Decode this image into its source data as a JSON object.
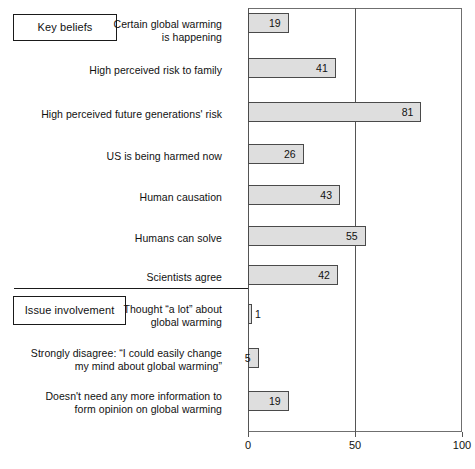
{
  "chart_data": {
    "type": "bar",
    "orientation": "horizontal",
    "title": "",
    "xlabel": "",
    "ylabel": "",
    "xlim": [
      0,
      100
    ],
    "xticks": [
      0,
      50,
      100
    ],
    "xtick_labels": [
      "0",
      "50",
      "100"
    ],
    "grid": "vertical gridline at 50 only",
    "legend": "none",
    "bar_fill_color": "#dedede",
    "bar_edge_color": "#4a4a4a",
    "groups": [
      {
        "name": "Key beliefs",
        "label": "Key beliefs",
        "categories": [
          "Certain global warming\nis happening",
          "High perceived risk to family",
          "High perceived future generations' risk",
          "US is being harmed now",
          "Human causation",
          "Humans can solve",
          "Scientists agree"
        ],
        "values": [
          19,
          41,
          81,
          26,
          43,
          55,
          42
        ]
      },
      {
        "name": "Issue involvement",
        "label": "Issue involvement",
        "categories": [
          "Thought “a lot” about\nglobal warming",
          "Strongly disagree: “I could easily change\nmy mind about global warming”",
          "Doesn't need any more information to\nform opinion on global warming"
        ],
        "values": [
          1,
          5,
          19
        ]
      }
    ],
    "categories": [
      "Certain global warming\nis happening",
      "High perceived risk to family",
      "High perceived future generations' risk",
      "US is being harmed now",
      "Human causation",
      "Humans can solve",
      "Scientists agree",
      "Thought “a lot” about\nglobal warming",
      "Strongly disagree: “I could easily change\nmy mind about global warming”",
      "Doesn't need any more information to\nform opinion on global warming"
    ],
    "values": [
      19,
      41,
      81,
      26,
      43,
      55,
      42,
      1,
      5,
      19
    ]
  },
  "rows": [
    {
      "label": "Certain global warming\nis happening",
      "value": 19,
      "value_text": "19",
      "label_top": 18,
      "bar_top": 13,
      "value_position": "inside"
    },
    {
      "label": "High perceived risk to family",
      "value": 41,
      "value_text": "41",
      "label_top": 64,
      "bar_top": 58,
      "value_position": "inside"
    },
    {
      "label": "High perceived future generations' risk",
      "value": 81,
      "value_text": "81",
      "label_top": 108,
      "bar_top": 102,
      "value_position": "inside"
    },
    {
      "label": "US is being harmed now",
      "value": 26,
      "value_text": "26",
      "label_top": 150,
      "bar_top": 144,
      "value_position": "inside"
    },
    {
      "label": "Human causation",
      "value": 43,
      "value_text": "43",
      "label_top": 191,
      "bar_top": 185,
      "value_position": "inside"
    },
    {
      "label": "Humans can solve",
      "value": 55,
      "value_text": "55",
      "label_top": 232,
      "bar_top": 226,
      "value_position": "inside"
    },
    {
      "label": "Scientists agree",
      "value": 42,
      "value_text": "42",
      "label_top": 271,
      "bar_top": 265,
      "value_position": "inside"
    },
    {
      "label": "Thought “a lot” about\nglobal warming",
      "value": 1,
      "value_text": "1",
      "label_top": 303,
      "bar_top": 304,
      "value_position": "outside"
    },
    {
      "label": "Strongly disagree: “I could easily change\nmy mind about global warming”",
      "value": 5,
      "value_text": "5",
      "label_top": 347,
      "bar_top": 348,
      "value_position": "inside"
    },
    {
      "label": "Doesn't need any more information to\nform opinion on global warming",
      "value": 19,
      "value_text": "19",
      "label_top": 390,
      "bar_top": 391,
      "value_position": "inside"
    }
  ],
  "axis": {
    "ticks": [
      {
        "value": 0,
        "label": "0",
        "x": 248
      },
      {
        "value": 50,
        "label": "50",
        "x": 355
      },
      {
        "value": 100,
        "label": "100",
        "x": 462
      }
    ]
  },
  "groups": {
    "key_beliefs_label": "Key beliefs",
    "issue_involvement_label": "Issue involvement"
  }
}
